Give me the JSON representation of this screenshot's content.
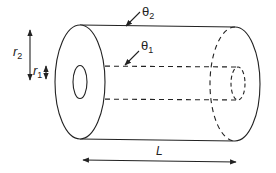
{
  "diagram": {
    "type": "hollow-cylinder",
    "labels": {
      "theta2": {
        "symbol": "θ",
        "subscript": "2",
        "meaning": "outer surface"
      },
      "theta1": {
        "symbol": "θ",
        "subscript": "1",
        "meaning": "inner surface"
      },
      "r2": {
        "symbol": "r",
        "subscript": "2",
        "meaning": "outer radius"
      },
      "r1": {
        "symbol": "r",
        "subscript": "1",
        "meaning": "inner radius"
      },
      "length": {
        "symbol": "L",
        "meaning": "cylinder length"
      }
    },
    "colors": {
      "stroke": "#222222",
      "background": "#ffffff"
    }
  }
}
